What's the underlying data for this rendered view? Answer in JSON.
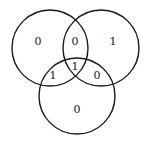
{
  "diagram": {
    "type": "venn-3-set",
    "stroke_color": "#1a1a1a",
    "background": "#ffffff",
    "circles": [
      {
        "id": "A",
        "position": "top-left",
        "cx": 50,
        "cy": 48,
        "r": 38
      },
      {
        "id": "B",
        "position": "top-right",
        "cx": 101,
        "cy": 48,
        "r": 38
      },
      {
        "id": "C",
        "position": "bottom",
        "cx": 77,
        "cy": 96,
        "r": 38
      }
    ],
    "regions": {
      "a_only": {
        "label": "0",
        "x": 38,
        "y": 41
      },
      "ab_only": {
        "label": "0",
        "x": 75,
        "y": 41
      },
      "b_only": {
        "label": "1",
        "x": 113,
        "y": 41
      },
      "ac_only": {
        "label": "1",
        "x": 53,
        "y": 75
      },
      "abc": {
        "label": "1",
        "x": 75,
        "y": 66
      },
      "bc_only": {
        "label": "0",
        "x": 97,
        "y": 75
      },
      "c_only": {
        "label": "0",
        "x": 77,
        "y": 109
      }
    }
  }
}
